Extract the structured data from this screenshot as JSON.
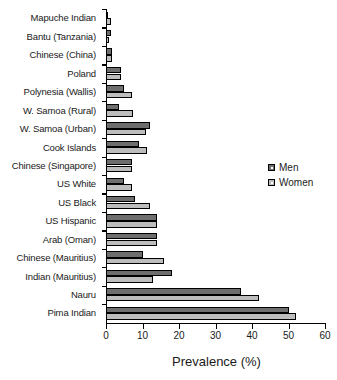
{
  "chart_data": {
    "type": "bar",
    "orientation": "horizontal",
    "title": "",
    "xlabel": "Prevalence (%)",
    "ylabel": "",
    "xlim": [
      0,
      60
    ],
    "xticks": [
      0,
      10,
      20,
      30,
      40,
      50,
      60
    ],
    "grid": false,
    "legend_position": "right-middle",
    "categories": [
      "Mapuche Indian",
      "Bantu (Tanzania)",
      "Chinese (China)",
      "Poland",
      "Polynesia (Wallis)",
      "W. Samoa (Rural)",
      "W. Samoa (Urban)",
      "Cook Islands",
      "Chinese (Singapore)",
      "US White",
      "US Black",
      "US Hispanic",
      "Arab (Oman)",
      "Chinese (Mauritius)",
      "Indian (Mauritius)",
      "Nauru",
      "Pima Indian"
    ],
    "series": [
      {
        "name": "Men",
        "color": "#6e6e6e",
        "values": [
          0.3,
          1.5,
          1.6,
          4.0,
          5.0,
          3.6,
          12.0,
          9.0,
          7.0,
          5.0,
          8.0,
          14.0,
          14.0,
          10.0,
          18.0,
          37.0,
          50.0
        ]
      },
      {
        "name": "Women",
        "color": "#bdbdbd",
        "values": [
          1.3,
          0.9,
          1.6,
          4.2,
          7.2,
          7.5,
          11.0,
          11.2,
          7.0,
          7.0,
          12.0,
          14.0,
          14.0,
          16.0,
          13.0,
          42.0,
          52.0
        ]
      }
    ]
  },
  "legend": {
    "entries": [
      {
        "label": "Men"
      },
      {
        "label": "Women"
      }
    ]
  },
  "axis": {
    "x_title": "Prevalence (%)",
    "tick_labels": [
      "0",
      "10",
      "20",
      "30",
      "40",
      "50",
      "60"
    ]
  }
}
